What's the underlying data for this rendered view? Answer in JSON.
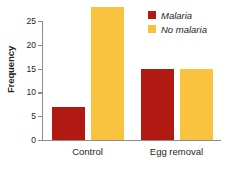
{
  "chart_data": {
    "type": "bar",
    "title": "",
    "xlabel": "",
    "ylabel": "Frequency",
    "categories": [
      "Control",
      "Egg removal"
    ],
    "series": [
      {
        "name": "Malaria",
        "color": "#b01a12",
        "values": [
          7,
          15
        ]
      },
      {
        "name": "No malaria",
        "color": "#f9c23f",
        "values": [
          28,
          15
        ]
      }
    ],
    "ylim": [
      0,
      29
    ],
    "yticks": [
      0,
      5,
      10,
      15,
      20,
      25
    ],
    "ytick_labels": [
      "0",
      "5",
      "10",
      "15",
      "20",
      "25"
    ],
    "grid": false,
    "legend_position": "top-right"
  },
  "legend": {
    "items": [
      {
        "label": "Malaria",
        "color": "#b01a12"
      },
      {
        "label": "No malaria",
        "color": "#f9c23f"
      }
    ]
  },
  "axis": {
    "y_title": "Frequency",
    "axis_color": "#8a8c8e"
  },
  "colors": {
    "malaria": "#b01a12",
    "no_malaria": "#f9c23f",
    "text": "#231f20",
    "background": "#ffffff"
  }
}
